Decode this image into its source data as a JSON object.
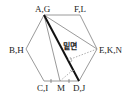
{
  "diagram": {
    "type": "geometry-hexagon",
    "labels": {
      "top_left": "A,G",
      "top_right": "F,L",
      "left": "B,H",
      "right": "E,K,N",
      "bottom_left": "C,I",
      "bottom_mid": "M",
      "bottom_right": "D,J",
      "face": "밑면"
    },
    "colors": {
      "outline": "#9a9a9a",
      "bold_edge": "#111111",
      "dotted": "#9a9a9a"
    }
  }
}
